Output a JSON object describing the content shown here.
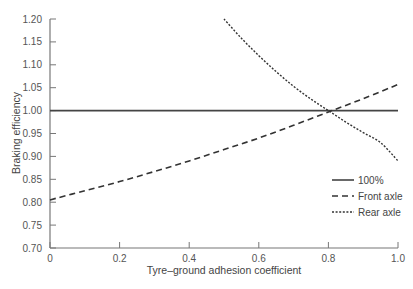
{
  "chart_data": {
    "type": "line",
    "title": "",
    "xlabel": "Tyre–ground adhesion coefficient",
    "ylabel": "Braking efficiency",
    "xlim": [
      0,
      1.0
    ],
    "ylim": [
      0.7,
      1.2
    ],
    "xticks": [
      0,
      0.2,
      0.4,
      0.6,
      0.8,
      1.0
    ],
    "xtick_labels": [
      "0",
      "0.2",
      "0.4",
      "0.6",
      "0.8",
      "1.0"
    ],
    "yticks": [
      0.7,
      0.75,
      0.8,
      0.85,
      0.9,
      0.95,
      1.0,
      1.05,
      1.1,
      1.15,
      1.2
    ],
    "ytick_labels": [
      "0.70",
      "0.75",
      "0.80",
      "0.85",
      "0.90",
      "0.95",
      "1.00",
      "1.05",
      "1.10",
      "1.15",
      "1.20"
    ],
    "grid": false,
    "legend_position": "lower right",
    "series": [
      {
        "name": "100%",
        "style": "solid",
        "x": [
          0,
          0.2,
          0.4,
          0.6,
          0.8,
          1.0
        ],
        "values": [
          1.0,
          1.0,
          1.0,
          1.0,
          1.0,
          1.0
        ]
      },
      {
        "name": "Front axle",
        "style": "dashed",
        "x": [
          0,
          0.1,
          0.2,
          0.3,
          0.4,
          0.5,
          0.6,
          0.7,
          0.8,
          0.9,
          1.0
        ],
        "values": [
          0.805,
          0.825,
          0.845,
          0.867,
          0.89,
          0.915,
          0.94,
          0.968,
          0.997,
          1.026,
          1.057
        ]
      },
      {
        "name": "Rear axle",
        "style": "dotted",
        "x": [
          0.5,
          0.55,
          0.6,
          0.65,
          0.7,
          0.75,
          0.8,
          0.85,
          0.9,
          0.95,
          1.0
        ],
        "values": [
          1.2,
          1.158,
          1.12,
          1.085,
          1.053,
          1.025,
          1.0,
          0.975,
          0.952,
          0.93,
          0.89
        ]
      }
    ],
    "annotations": []
  }
}
